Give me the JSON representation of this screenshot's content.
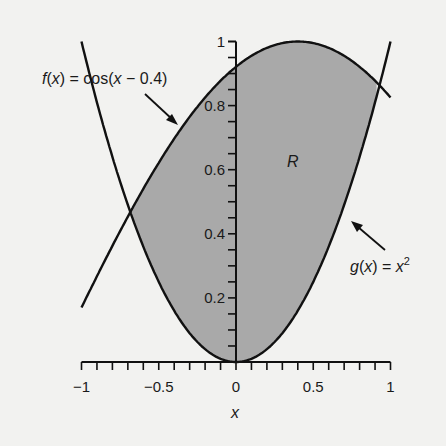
{
  "chart_data": {
    "type": "area",
    "title": "",
    "xlabel": "x",
    "ylabel": "",
    "xlim": [
      -1,
      1
    ],
    "ylim": [
      0,
      1
    ],
    "grid": false,
    "x_ticks": [
      -1,
      -0.5,
      0,
      0.5,
      1
    ],
    "x_tick_labels": [
      "−1",
      "−0.5",
      "0",
      "0.5",
      "1"
    ],
    "x_minor_step": 0.1,
    "y_ticks": [
      0.2,
      0.4,
      0.6,
      0.8,
      1
    ],
    "y_tick_labels": [
      "0.2",
      "0.4",
      "0.6",
      "0.8",
      "1"
    ],
    "y_minor_step": 0.05,
    "series": [
      {
        "name": "f(x) = cos(x − 0.4)",
        "function": "cos(x-0.4)",
        "domain": [
          -1,
          1
        ],
        "x": [
          -1,
          -0.8,
          -0.6,
          -0.4,
          -0.2,
          0,
          0.2,
          0.4,
          0.6,
          0.8,
          1
        ],
        "values": [
          0.17,
          0.362,
          0.54,
          0.697,
          0.825,
          0.921,
          0.98,
          1.0,
          0.98,
          0.921,
          0.825
        ]
      },
      {
        "name": "g(x) = x²",
        "function": "x^2",
        "domain": [
          -1,
          1
        ],
        "x": [
          -1,
          -0.8,
          -0.6,
          -0.4,
          -0.2,
          0,
          0.2,
          0.4,
          0.6,
          0.8,
          1
        ],
        "values": [
          1,
          0.64,
          0.36,
          0.16,
          0.04,
          0,
          0.04,
          0.16,
          0.36,
          0.64,
          1
        ]
      }
    ],
    "shaded_region": {
      "label": "R",
      "between": [
        "f",
        "g"
      ],
      "x_range": [
        -0.68,
        0.91
      ],
      "color": "#a9a9a9"
    },
    "annotations": [
      {
        "text_parts": [
          "f",
          "(",
          "x",
          ") = cos(",
          "x",
          " − 0.4)"
        ],
        "points_to": "f"
      },
      {
        "text_parts": [
          "g",
          "(",
          "x",
          ") = ",
          "x",
          "2"
        ],
        "points_to": "g"
      }
    ]
  },
  "labels": {
    "region": "R",
    "x_axis": "x",
    "f_label": {
      "f": "f",
      "open": "(",
      "x": "x",
      "rest": ") = cos(",
      "x2": "x",
      "tail": " − 0.4)"
    },
    "g_label": {
      "g": "g",
      "open": "(",
      "x": "x",
      "rest": ") = ",
      "x2": "x",
      "sup": "2"
    }
  },
  "colors": {
    "background": "#f2f2f0",
    "fill": "#a9a9a9",
    "line": "#111111"
  }
}
